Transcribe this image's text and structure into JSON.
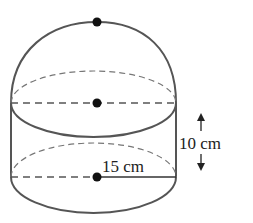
{
  "diagram": {
    "type": "composite-solid",
    "shapes": [
      {
        "name": "hemisphere",
        "radius_label": "15 cm"
      },
      {
        "name": "cylinder",
        "radius_label": "15 cm",
        "height_label": "10 cm"
      }
    ],
    "labels": {
      "height": "10 cm",
      "radius": "15 cm"
    },
    "points": [
      {
        "name": "hemisphere-top",
        "x": 97,
        "y": 22
      },
      {
        "name": "hemisphere-center",
        "x": 97,
        "y": 103
      },
      {
        "name": "cylinder-base-center",
        "x": 97,
        "y": 177
      }
    ],
    "colors": {
      "outline": "#555555",
      "dashed": "#666666",
      "dot": "#111111",
      "text": "#222222",
      "background": "#ffffff"
    }
  }
}
